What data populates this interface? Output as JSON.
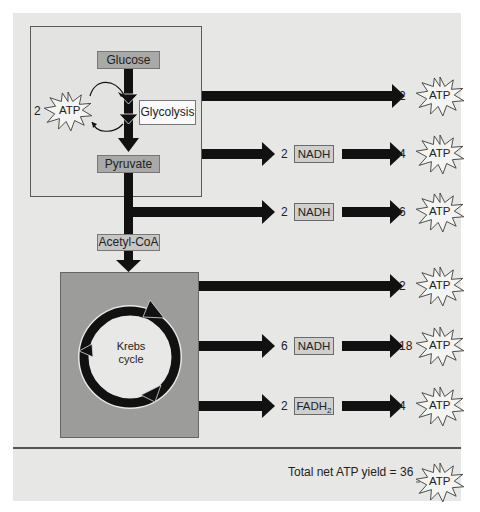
{
  "glycolysis": {
    "input": "Glucose",
    "process_label": "Glycolysis",
    "output": "Pyruvate",
    "invested_atp": {
      "count": "2",
      "label": "ATP"
    }
  },
  "intermediate": {
    "label": "Acetyl-CoA"
  },
  "krebs": {
    "label_line1": "Krebs",
    "label_line2": "cycle"
  },
  "yields": [
    {
      "source": "glycolysis",
      "carrier_count": "",
      "carrier": "",
      "atp_count": "2",
      "atp_label": "ATP"
    },
    {
      "source": "glycolysis",
      "carrier_count": "2",
      "carrier": "NADH",
      "atp_count": "4",
      "atp_label": "ATP"
    },
    {
      "source": "pyruvate-oxidation",
      "carrier_count": "2",
      "carrier": "NADH",
      "atp_count": "6",
      "atp_label": "ATP"
    },
    {
      "source": "krebs",
      "carrier_count": "",
      "carrier": "",
      "atp_count": "2",
      "atp_label": "ATP"
    },
    {
      "source": "krebs",
      "carrier_count": "6",
      "carrier": "NADH",
      "atp_count": "18",
      "atp_label": "ATP"
    },
    {
      "source": "krebs",
      "carrier_count": "2",
      "carrier": "FADH",
      "carrier_subscript": "2",
      "atp_count": "4",
      "atp_label": "ATP"
    }
  ],
  "total": {
    "text": "Total net ATP yield = 36",
    "atp_label": "ATP"
  },
  "colors": {
    "background": "#e7e7e5",
    "label_box": "#a9a9a7",
    "krebs_box": "#9c9c9a",
    "arrow": "#111111"
  }
}
